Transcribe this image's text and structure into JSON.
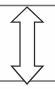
{
  "canvas": {
    "width": 55,
    "height": 89,
    "background_color": "#fefefe"
  },
  "figure": {
    "title": "Vertical double-headed arrow between two horizontal rules"
  },
  "arrow": {
    "name": "double-headed-vertical-arrow",
    "direction": "up-down",
    "fill_color": "#ffffff",
    "stroke_color": "#2b2b2b",
    "stroke_width": 1.25,
    "apex_top": {
      "x": 27,
      "y": 7
    },
    "apex_bottom": {
      "x": 27,
      "y": 84
    },
    "barb_left_x": 11.5,
    "barb_right_x": 43,
    "barb_top_y": 22,
    "barb_bottom_y": 66,
    "shaft_left_x": 20,
    "shaft_right_x": 34.5,
    "points": "27,7 43,22 34.5,22 34.5,66 43,66 27,84 11.5,66 20,66 20,22 11.5,22"
  },
  "rules": [
    {
      "name": "top-rule",
      "y": 5.5,
      "x1": 0,
      "x2": 55,
      "color": "#6f6f6f",
      "thickness": 1.4
    },
    {
      "name": "bottom-rule",
      "y": 81,
      "x1": 0,
      "x2": 55,
      "color": "#6f6f6f",
      "thickness": 1.4
    }
  ]
}
